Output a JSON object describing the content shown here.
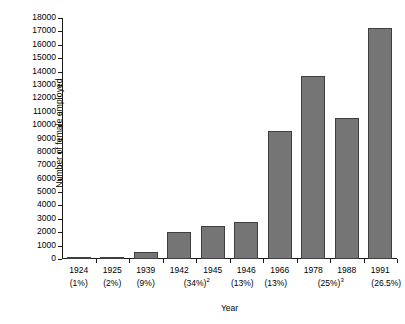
{
  "chart_data": {
    "type": "bar",
    "title": "",
    "xlabel": "Year",
    "ylabel": "Number of female employed",
    "ylim": [
      0,
      18000
    ],
    "ytick_step": 1000,
    "grid": false,
    "legend": false,
    "bar_color": "#757575",
    "bar_edge_color": "#3f3f3f",
    "axis_color": "#1a1a1a",
    "categories": [
      "1924",
      "1925",
      "1939",
      "1942",
      "1945",
      "1946",
      "1966",
      "1978",
      "1988",
      "1991"
    ],
    "category_sublabels": [
      "(1%)",
      "(2%)",
      "(9%)",
      "",
      "(34%)",
      "(13%)",
      "(13%)",
      "",
      "(25%)",
      "(26.5%)"
    ],
    "category_sublabel_superscripts": [
      "",
      "",
      "",
      "",
      "2",
      "",
      "",
      "",
      "3",
      ""
    ],
    "values": [
      120,
      110,
      520,
      2020,
      2430,
      2780,
      9560,
      13700,
      10530,
      17250
    ],
    "ytick_labels": [
      "0",
      "1000",
      "2000",
      "3000",
      "4000",
      "5000",
      "6000",
      "7000",
      "8000",
      "9000",
      "10000",
      "11000",
      "12000",
      "13000",
      "14000",
      "15000",
      "16000",
      "17000",
      "18000"
    ],
    "ytick_values": [
      0,
      1000,
      2000,
      3000,
      4000,
      5000,
      6000,
      7000,
      8000,
      9000,
      10000,
      11000,
      12000,
      13000,
      14000,
      15000,
      16000,
      17000,
      18000
    ]
  }
}
